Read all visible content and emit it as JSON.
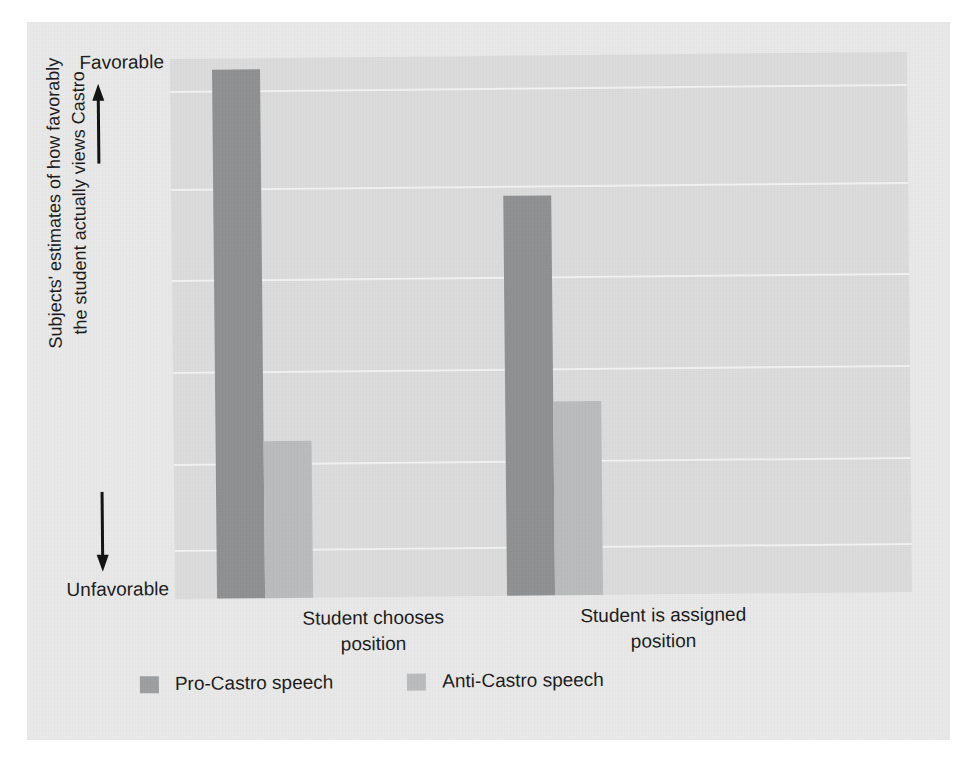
{
  "figure": {
    "background_color": "#e9e9e9",
    "plot_background_color": "#dcdcdc",
    "gridline_color": "#f2f2f2"
  },
  "axis": {
    "y_top_label": "Favorable",
    "y_bottom_label": "Unfavorable",
    "y_title": "Subjects' estimates of how favorably\nthe student actually views Castro",
    "up_arrow_icon": "arrow-up-icon",
    "down_arrow_icon": "arrow-down-icon"
  },
  "legend": {
    "entries": [
      {
        "label": "Pro-Castro speech",
        "color": "#8e9092",
        "swatch_icon": "legend-swatch-pro"
      },
      {
        "label": "Anti-Castro speech",
        "color": "#b9bbbc",
        "swatch_icon": "legend-swatch-anti"
      }
    ]
  },
  "chart_data": {
    "type": "bar",
    "title": "",
    "subtitle": "",
    "xlabel": "",
    "ylabel": "Subjects' estimates of how favorably the student actually views Castro",
    "categories": [
      "Student chooses\nposition",
      "Student is assigned\nposition"
    ],
    "series": [
      {
        "name": "Pro-Castro speech",
        "color": "#8e9092",
        "values": [
          98,
          74
        ]
      },
      {
        "name": "Anti-Castro speech",
        "color": "#b9bbbc",
        "values": [
          29,
          36
        ]
      }
    ],
    "ylim": [
      0,
      100
    ],
    "ytick_labels": [
      "Unfavorable",
      "Favorable"
    ],
    "value_unit": "percent-of-scale",
    "grid": true,
    "gridline_positions": [
      6,
      24,
      41,
      58,
      75,
      91
    ],
    "legend_position": "bottom-left",
    "annotations": []
  }
}
